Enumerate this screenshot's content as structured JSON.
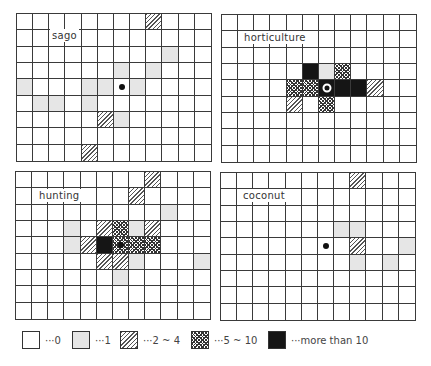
{
  "figure": {
    "grid_columns": 12,
    "grid_rows": 9,
    "panels": [
      {
        "id": "sago",
        "label": "sago",
        "center": {
          "row": 4,
          "col": 6,
          "marker": "dot"
        },
        "cells": [
          {
            "row": 0,
            "col": 8,
            "level": 2
          },
          {
            "row": 2,
            "col": 9,
            "level": 1
          },
          {
            "row": 3,
            "col": 6,
            "level": 1
          },
          {
            "row": 3,
            "col": 8,
            "level": 1
          },
          {
            "row": 4,
            "col": 0,
            "level": 1
          },
          {
            "row": 4,
            "col": 4,
            "level": 1
          },
          {
            "row": 4,
            "col": 5,
            "level": 1
          },
          {
            "row": 4,
            "col": 7,
            "level": 1
          },
          {
            "row": 5,
            "col": 1,
            "level": 1
          },
          {
            "row": 5,
            "col": 2,
            "level": 1
          },
          {
            "row": 5,
            "col": 4,
            "level": 1
          },
          {
            "row": 6,
            "col": 5,
            "level": 2
          },
          {
            "row": 6,
            "col": 6,
            "level": 1
          },
          {
            "row": 8,
            "col": 4,
            "level": 2
          }
        ]
      },
      {
        "id": "horticulture",
        "label": "horticulture",
        "center": {
          "row": 4,
          "col": 6,
          "marker": "ring"
        },
        "cells": [
          {
            "row": 3,
            "col": 5,
            "level": 4
          },
          {
            "row": 3,
            "col": 6,
            "level": 1
          },
          {
            "row": 3,
            "col": 7,
            "level": 3
          },
          {
            "row": 4,
            "col": 4,
            "level": 3
          },
          {
            "row": 4,
            "col": 5,
            "level": 3
          },
          {
            "row": 4,
            "col": 6,
            "level": 4
          },
          {
            "row": 4,
            "col": 7,
            "level": 4
          },
          {
            "row": 4,
            "col": 8,
            "level": 4
          },
          {
            "row": 4,
            "col": 9,
            "level": 2
          },
          {
            "row": 5,
            "col": 4,
            "level": 2
          },
          {
            "row": 5,
            "col": 6,
            "level": 3
          }
        ]
      },
      {
        "id": "hunting",
        "label": "hunting",
        "center": {
          "row": 4,
          "col": 6,
          "marker": "dot"
        },
        "cells": [
          {
            "row": 0,
            "col": 8,
            "level": 2
          },
          {
            "row": 1,
            "col": 7,
            "level": 2
          },
          {
            "row": 2,
            "col": 9,
            "level": 1
          },
          {
            "row": 3,
            "col": 3,
            "level": 1
          },
          {
            "row": 3,
            "col": 5,
            "level": 2
          },
          {
            "row": 3,
            "col": 6,
            "level": 3
          },
          {
            "row": 3,
            "col": 7,
            "level": 1
          },
          {
            "row": 3,
            "col": 8,
            "level": 2
          },
          {
            "row": 4,
            "col": 3,
            "level": 1
          },
          {
            "row": 4,
            "col": 4,
            "level": 2
          },
          {
            "row": 4,
            "col": 5,
            "level": 4
          },
          {
            "row": 4,
            "col": 6,
            "level": 3
          },
          {
            "row": 4,
            "col": 7,
            "level": 3
          },
          {
            "row": 4,
            "col": 8,
            "level": 3
          },
          {
            "row": 5,
            "col": 5,
            "level": 2
          },
          {
            "row": 5,
            "col": 6,
            "level": 2
          },
          {
            "row": 5,
            "col": 7,
            "level": 1
          },
          {
            "row": 5,
            "col": 11,
            "level": 1
          },
          {
            "row": 6,
            "col": 6,
            "level": 1
          }
        ]
      },
      {
        "id": "coconut",
        "label": "coconut",
        "center": {
          "row": 4,
          "col": 6,
          "marker": "dot"
        },
        "cells": [
          {
            "row": 0,
            "col": 8,
            "level": 2
          },
          {
            "row": 3,
            "col": 7,
            "level": 1
          },
          {
            "row": 3,
            "col": 8,
            "level": 1
          },
          {
            "row": 4,
            "col": 8,
            "level": 2
          },
          {
            "row": 4,
            "col": 11,
            "level": 1
          },
          {
            "row": 5,
            "col": 8,
            "level": 1
          },
          {
            "row": 5,
            "col": 10,
            "level": 1
          }
        ]
      }
    ]
  },
  "legend": {
    "items": [
      {
        "level": 0,
        "pattern": "blank",
        "text": "···0"
      },
      {
        "level": 1,
        "pattern": "light-dotted",
        "text": "···1"
      },
      {
        "level": 2,
        "pattern": "diagonal-hatch",
        "text": "···2 ~ 4"
      },
      {
        "level": 3,
        "pattern": "cross-hatch",
        "text": "···5 ~ 10"
      },
      {
        "level": 4,
        "pattern": "solid-black",
        "text": "···more than 10"
      }
    ]
  },
  "colors": {
    "grid_line": "#3a3a3a",
    "level1": "#e6e6e6",
    "level4": "#151515"
  }
}
